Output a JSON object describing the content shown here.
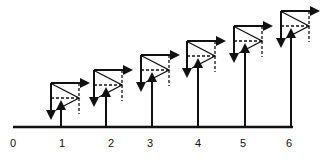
{
  "diagram": {
    "baseline": {
      "x1": 13,
      "x2": 292,
      "y": 127
    },
    "labels": [
      {
        "text": "0",
        "x": 13,
        "y": 147
      },
      {
        "text": "1",
        "x": 62,
        "y": 147
      },
      {
        "text": "2",
        "x": 111,
        "y": 147
      },
      {
        "text": "3",
        "x": 150,
        "y": 147
      },
      {
        "text": "4",
        "x": 198,
        "y": 147
      },
      {
        "text": "5",
        "x": 243,
        "y": 147
      },
      {
        "text": "6",
        "x": 289,
        "y": 147
      }
    ],
    "figures": [
      {
        "id": 1,
        "x": 51,
        "y": 83,
        "stem_x": 61
      },
      {
        "id": 2,
        "x": 94,
        "y": 70,
        "stem_x": 106
      },
      {
        "id": 3,
        "x": 141,
        "y": 55,
        "stem_x": 152
      },
      {
        "id": 4,
        "x": 187,
        "y": 41,
        "stem_x": 198
      },
      {
        "id": 5,
        "x": 234,
        "y": 26,
        "stem_x": 245
      },
      {
        "id": 6,
        "x": 281,
        "y": 11,
        "stem_x": 291
      }
    ],
    "colors": {
      "ink": "#111111",
      "background": "#ffffff"
    }
  }
}
